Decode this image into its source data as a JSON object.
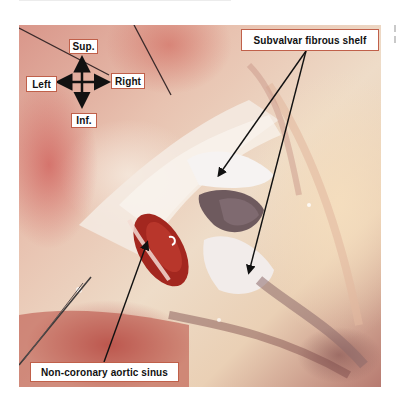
{
  "figure": {
    "orientation": {
      "up": "Sup.",
      "down": "Inf.",
      "left": "Left",
      "right": "Right"
    },
    "annotations": [
      {
        "id": "subvalvar-fibrous-shelf",
        "text": "Subvalvar fibrous shelf",
        "arrow_count": 2
      },
      {
        "id": "non-coronary-aortic-sinus",
        "text": "Non-coronary aortic sinus",
        "arrow_count": 1
      }
    ],
    "colors": {
      "label_border": "#c0604a",
      "label_fill": "#ffffff",
      "arrow": "#111111"
    }
  }
}
